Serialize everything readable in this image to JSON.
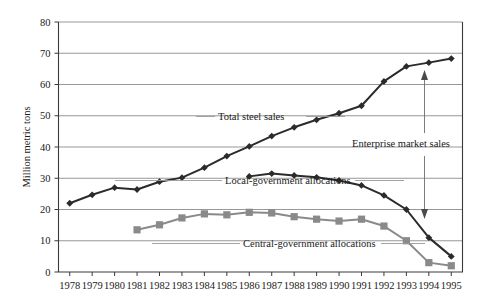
{
  "chart_data": {
    "type": "line",
    "title": "",
    "subtitle": "",
    "xlabel": "",
    "ylabel": "Million metric tons",
    "ylim": [
      0,
      80
    ],
    "yticks": [
      0,
      10,
      20,
      30,
      40,
      50,
      60,
      70,
      80
    ],
    "grid": true,
    "legend_position": "inline-annotations",
    "x": [
      1978,
      1979,
      1980,
      1981,
      1982,
      1983,
      1984,
      1985,
      1986,
      1987,
      1988,
      1989,
      1990,
      1991,
      1992,
      1993,
      1994,
      1995
    ],
    "categories": [
      "1978",
      "1979",
      "1980",
      "1981",
      "1982",
      "1983",
      "1984",
      "1985",
      "1986",
      "1987",
      "1988",
      "1989",
      "1990",
      "1991",
      "1992",
      "1993",
      "1994",
      "1995"
    ],
    "series": [
      {
        "name": "Total steel sales",
        "color": "#2b2b2b",
        "marker": "diamond",
        "values": [
          22.0,
          24.7,
          27.0,
          26.4,
          28.9,
          30.2,
          33.4,
          37.1,
          40.2,
          43.5,
          46.3,
          48.7,
          50.8,
          53.2,
          61.0,
          65.8,
          67.0,
          68.3
        ]
      },
      {
        "name": "Local-government allocations",
        "color": "#2b2b2b",
        "marker": "diamond",
        "values": [
          null,
          null,
          null,
          null,
          null,
          null,
          null,
          null,
          30.6,
          31.5,
          30.9,
          30.3,
          29.3,
          27.7,
          24.5,
          20.0,
          11.0,
          5.0
        ]
      },
      {
        "name": "Central-government allocations",
        "color": "#8a8a8a",
        "marker": "square",
        "values": [
          null,
          null,
          null,
          13.5,
          15.1,
          17.3,
          18.6,
          18.3,
          19.1,
          18.9,
          17.7,
          16.9,
          16.3,
          16.9,
          14.7,
          10.0,
          3.0,
          2.0
        ]
      }
    ],
    "annotations": [
      {
        "label": "Total steel sales",
        "leader": "right-to-left"
      },
      {
        "label": "Local-government allocations",
        "leader": "right-to-left"
      },
      {
        "label": "Central-government allocations",
        "leader": "both-sides"
      },
      {
        "label": "Enterprise market sales",
        "leader": "vertical-double-arrow"
      }
    ]
  },
  "axis": {
    "y_title": "Million metric tons",
    "y_tick_labels": [
      "0",
      "10",
      "20",
      "30",
      "40",
      "50",
      "60",
      "70",
      "80"
    ],
    "x_tick_labels": [
      "1978",
      "1979",
      "1980",
      "1981",
      "1982",
      "1983",
      "1984",
      "1985",
      "1986",
      "1987",
      "1988",
      "1989",
      "1990",
      "1991",
      "1992",
      "1993",
      "1994",
      "1995"
    ]
  },
  "labels": {
    "total_steel_sales": "Total steel sales",
    "local_government_allocations": "Local-government allocations",
    "central_government_allocations": "Central-government allocations",
    "enterprise_market_sales": "Enterprise market sales"
  },
  "colors": {
    "dark_series": "#2b2b2b",
    "gray_series": "#8a8a8a",
    "gridline": "#8c8c8c",
    "axis": "#3a3a3a",
    "background": "#ffffff"
  }
}
